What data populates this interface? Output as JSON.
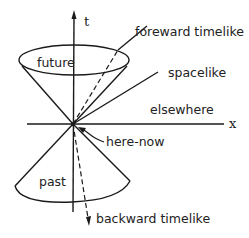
{
  "diagram": {
    "axes": {
      "t_label": "t",
      "x_label": "x"
    },
    "regions": {
      "future": "future",
      "past": "past",
      "elsewhere": "elsewhere"
    },
    "lines": {
      "forward_timelike": "foreward timelike",
      "spacelike": "spacelike",
      "backward_timelike": "backward timelike"
    },
    "origin_label": "here-now",
    "colors": {
      "ink": "#1a1a1a",
      "background": "#ffffff"
    }
  }
}
